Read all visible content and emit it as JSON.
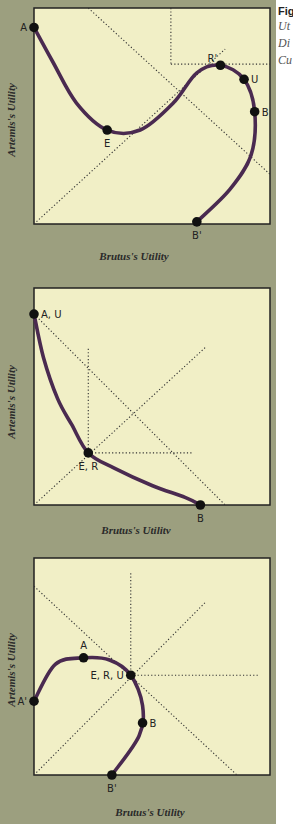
{
  "caption": {
    "figure_label": "Fig",
    "lines": [
      "Ut",
      "Di",
      "Cu"
    ]
  },
  "colors": {
    "frame": "#9c9f7f",
    "plot_bg": "#f1efc6",
    "curve": "#4a2a50",
    "point": "#111111",
    "guide": "#333333"
  },
  "chart_data": [
    {
      "type": "line",
      "title": "",
      "xlabel": "Brutus's Utility",
      "ylabel": "Artemis's Utility",
      "xlim": [
        0,
        10
      ],
      "ylim": [
        0,
        10
      ],
      "curve": [
        [
          0,
          9.1
        ],
        [
          0.8,
          7.5
        ],
        [
          1.8,
          5.6
        ],
        [
          3.1,
          4.35
        ],
        [
          4.5,
          4.35
        ],
        [
          5.9,
          5.6
        ],
        [
          6.9,
          7.0
        ],
        [
          7.9,
          7.35
        ],
        [
          8.9,
          6.7
        ],
        [
          9.35,
          5.2
        ],
        [
          9.2,
          3.2
        ],
        [
          8.3,
          1.6
        ],
        [
          6.9,
          0.1
        ]
      ],
      "points": [
        {
          "label": "A",
          "x": 0,
          "y": 9.1,
          "label_pos": "left"
        },
        {
          "label": "E",
          "x": 3.1,
          "y": 4.35,
          "label_pos": "below"
        },
        {
          "label": "R'",
          "x": 7.9,
          "y": 7.35,
          "label_pos": "above-left"
        },
        {
          "label": "U",
          "x": 8.9,
          "y": 6.7,
          "label_pos": "right"
        },
        {
          "label": "B",
          "x": 9.35,
          "y": 5.2,
          "label_pos": "right"
        },
        {
          "label": "B'",
          "x": 6.9,
          "y": 0.1,
          "label_pos": "below"
        }
      ],
      "guides": [
        {
          "from": [
            0,
            0
          ],
          "to": [
            8.1,
            8.1
          ]
        },
        {
          "from": [
            2.3,
            10
          ],
          "to": [
            10,
            2.3
          ]
        },
        {
          "from": [
            5.8,
            10
          ],
          "to": [
            5.8,
            7.4
          ]
        },
        {
          "from": [
            5.8,
            7.4
          ],
          "to": [
            10.5,
            7.4
          ]
        }
      ]
    },
    {
      "type": "line",
      "title": "",
      "xlabel": "Brutus's Utility",
      "ylabel": "Artemis's Utility",
      "xlim": [
        0,
        10
      ],
      "ylim": [
        0,
        10
      ],
      "curve": [
        [
          0,
          8.8
        ],
        [
          0.4,
          6.8
        ],
        [
          1.0,
          4.9
        ],
        [
          1.6,
          3.7
        ],
        [
          2.3,
          2.4
        ],
        [
          3.4,
          1.7
        ],
        [
          5.0,
          0.9
        ],
        [
          6.4,
          0.35
        ],
        [
          7.05,
          0
        ]
      ],
      "points": [
        {
          "label": "A, U",
          "x": 0,
          "y": 8.8,
          "label_pos": "right"
        },
        {
          "label": "E, R",
          "x": 2.3,
          "y": 2.4,
          "label_pos": "below"
        },
        {
          "label": "B",
          "x": 7.05,
          "y": 0,
          "label_pos": "below"
        }
      ],
      "guides": [
        {
          "from": [
            0,
            0
          ],
          "to": [
            7.3,
            7.3
          ]
        },
        {
          "from": [
            0,
            8.8
          ],
          "to": [
            8.1,
            0
          ]
        },
        {
          "from": [
            2.3,
            7.2
          ],
          "to": [
            2.3,
            2.4
          ]
        },
        {
          "from": [
            2.3,
            2.4
          ],
          "to": [
            6.7,
            2.4
          ]
        }
      ]
    },
    {
      "type": "line",
      "title": "",
      "xlabel": "Brutus's Utility",
      "ylabel": "Artemis's Utility",
      "xlim": [
        0,
        10
      ],
      "ylim": [
        0,
        10
      ],
      "curve": [
        [
          0,
          3.4
        ],
        [
          0.9,
          5.1
        ],
        [
          2.1,
          5.4
        ],
        [
          3.2,
          5.3
        ],
        [
          4.1,
          4.6
        ],
        [
          4.6,
          3.2
        ],
        [
          4.45,
          1.8
        ],
        [
          3.3,
          0
        ]
      ],
      "points": [
        {
          "label": "A'",
          "x": 0,
          "y": 3.4,
          "label_pos": "left"
        },
        {
          "label": "A",
          "x": 2.1,
          "y": 5.4,
          "label_pos": "above"
        },
        {
          "label": "E, R, U",
          "x": 4.1,
          "y": 4.6,
          "label_pos": "left"
        },
        {
          "label": "B",
          "x": 4.6,
          "y": 2.4,
          "label_pos": "right"
        },
        {
          "label": "B'",
          "x": 3.3,
          "y": 0,
          "label_pos": "below"
        }
      ],
      "guides": [
        {
          "from": [
            0,
            0
          ],
          "to": [
            7.3,
            8.0
          ]
        },
        {
          "from": [
            0,
            8.7
          ],
          "to": [
            8.6,
            0
          ]
        },
        {
          "from": [
            4.1,
            9.3
          ],
          "to": [
            4.1,
            4.6
          ]
        },
        {
          "from": [
            4.1,
            4.6
          ],
          "to": [
            9.5,
            4.6
          ]
        }
      ]
    }
  ]
}
